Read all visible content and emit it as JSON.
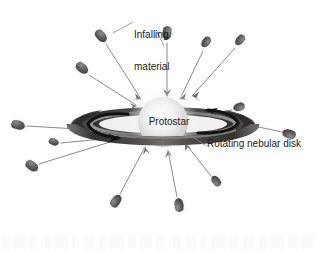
{
  "figure": {
    "background_color": "#ffffff",
    "width": 317,
    "height": 253
  },
  "labels": {
    "infalling_line1": "Infalling",
    "infalling_line2": "material",
    "protostar": "Protostar",
    "disk": "Rotating nebular disk"
  },
  "clipped_top_text": "",
  "colors": {
    "text": "#1b1b1b",
    "disk_dark": "#2e2c2c",
    "disk_mid": "#585655",
    "disk_light": "#9a9897",
    "blob_dark": "#555353",
    "blob_mid": "#8a8888",
    "arrow_line": "#6e6c6c",
    "star_core": "#fdfdfd",
    "star_edge": "#cfcfcf",
    "rotation_arrow": "#111010",
    "artifact": "#fafafb"
  },
  "diagram": {
    "protostar": {
      "cx": 163,
      "cy": 122,
      "r": 25
    },
    "disk": {
      "cx": 163,
      "cy": 124,
      "rx": 92,
      "ry": 17
    },
    "rotation_arrows": 2,
    "infalling_blobs": [
      {
        "id": "blob-top-left-far",
        "x": 101,
        "y": 36,
        "angle": 48
      },
      {
        "id": "blob-top-center",
        "x": 167,
        "y": 33,
        "angle": 95
      },
      {
        "id": "blob-top-right",
        "x": 206,
        "y": 42,
        "angle": 127
      },
      {
        "id": "blob-upper-left",
        "x": 82,
        "y": 68,
        "angle": 40
      },
      {
        "id": "blob-right-upper",
        "x": 240,
        "y": 40,
        "angle": 130
      },
      {
        "id": "blob-right-high",
        "x": 239,
        "y": 107,
        "angle": 160
      },
      {
        "id": "blob-left-mid",
        "x": 18,
        "y": 125,
        "angle": 12
      },
      {
        "id": "blob-left-lower",
        "x": 54,
        "y": 142,
        "angle": 22
      },
      {
        "id": "blob-left-bottom",
        "x": 32,
        "y": 166,
        "angle": 36
      },
      {
        "id": "blob-right-far",
        "x": 289,
        "y": 134,
        "angle": 196
      },
      {
        "id": "blob-bottom-left",
        "x": 116,
        "y": 201,
        "angle": 305
      },
      {
        "id": "blob-bottom-center",
        "x": 179,
        "y": 205,
        "angle": 265
      },
      {
        "id": "blob-bottom-right",
        "x": 216,
        "y": 181,
        "angle": 232
      }
    ],
    "leader_lines": [
      {
        "id": "leader-infalling-left",
        "from": [
          133,
          22
        ],
        "to": [
          113,
          33
        ]
      },
      {
        "id": "leader-infalling-right",
        "from": [
          157,
          30
        ],
        "to": [
          164,
          45
        ]
      },
      {
        "id": "leader-disk",
        "from": [
          206,
          146
        ],
        "to": [
          186,
          133
        ]
      }
    ]
  },
  "bottom_artifacts": [
    {
      "x": 2,
      "w": 7
    },
    {
      "x": 14,
      "w": 11
    },
    {
      "x": 30,
      "w": 6
    },
    {
      "x": 41,
      "w": 9
    },
    {
      "x": 55,
      "w": 12
    },
    {
      "x": 72,
      "w": 7
    },
    {
      "x": 84,
      "w": 10
    },
    {
      "x": 99,
      "w": 6
    },
    {
      "x": 110,
      "w": 13
    },
    {
      "x": 128,
      "w": 8
    },
    {
      "x": 141,
      "w": 11
    },
    {
      "x": 157,
      "w": 7
    },
    {
      "x": 169,
      "w": 12
    },
    {
      "x": 186,
      "w": 9
    },
    {
      "x": 200,
      "w": 6
    },
    {
      "x": 211,
      "w": 14
    },
    {
      "x": 230,
      "w": 8
    },
    {
      "x": 243,
      "w": 11
    },
    {
      "x": 259,
      "w": 7
    },
    {
      "x": 271,
      "w": 12
    },
    {
      "x": 288,
      "w": 9
    },
    {
      "x": 302,
      "w": 11
    }
  ]
}
